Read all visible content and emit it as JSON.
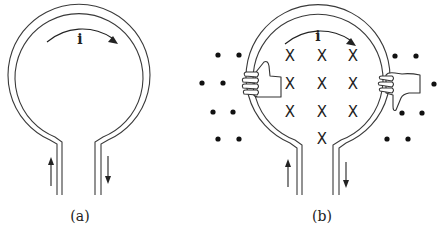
{
  "figure": {
    "panel_a": {
      "label": "(a)",
      "current_label": "i",
      "loop": {
        "cx": 79,
        "cy": 84,
        "r_outer": 71,
        "r_inner": 64
      },
      "stems": {
        "left_outer_x": 57,
        "left_inner_x": 62,
        "right_inner_x": 95,
        "right_outer_x": 101,
        "bottom_y": 195
      },
      "arrows": {
        "left": {
          "x": 51,
          "direction": "up"
        },
        "right": {
          "x": 108,
          "direction": "down"
        },
        "top": {
          "direction": "clockwise"
        }
      }
    },
    "panel_b": {
      "label": "(b)",
      "current_label": "i",
      "loop": {
        "cx": 320,
        "cy": 86,
        "r_outer": 72,
        "r_inner": 65
      },
      "stems": {
        "left_outer_x": 297,
        "left_inner_x": 302,
        "right_inner_x": 333,
        "right_outer_x": 339,
        "bottom_y": 195
      },
      "arrows": {
        "left": {
          "x": 288,
          "direction": "up"
        },
        "right": {
          "x": 346,
          "direction": "down"
        },
        "top": {
          "direction": "clockwise"
        }
      },
      "field_inside_symbol": "X",
      "field_inside_meaning": "magnetic field into page",
      "field_inside": [
        [
          290,
          56
        ],
        [
          322,
          56
        ],
        [
          353,
          56
        ],
        [
          290,
          84
        ],
        [
          322,
          84
        ],
        [
          353,
          84
        ],
        [
          290,
          112
        ],
        [
          322,
          112
        ],
        [
          353,
          112
        ],
        [
          322,
          139
        ]
      ],
      "field_outside_symbol": "•",
      "field_outside_meaning": "magnetic field out of page",
      "field_outside": [
        [
          218,
          55
        ],
        [
          239,
          55
        ],
        [
          202,
          83
        ],
        [
          223,
          83
        ],
        [
          213,
          112
        ],
        [
          233,
          112
        ],
        [
          218,
          139
        ],
        [
          239,
          139
        ],
        [
          395,
          56
        ],
        [
          416,
          56
        ],
        [
          434,
          84
        ],
        [
          402,
          113
        ],
        [
          422,
          113
        ],
        [
          387,
          139
        ],
        [
          408,
          139
        ]
      ],
      "hands": [
        {
          "side": "left",
          "thumb": "up"
        },
        {
          "side": "right",
          "thumb": "down"
        }
      ]
    }
  }
}
